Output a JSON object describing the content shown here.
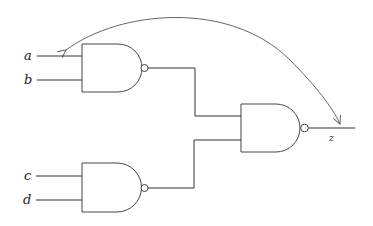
{
  "diagram": {
    "type": "logic-circuit",
    "gates": [
      {
        "id": "nand-1",
        "kind": "NAND",
        "inputs": [
          "a",
          "b"
        ]
      },
      {
        "id": "nand-2",
        "kind": "NAND",
        "inputs": [
          "c",
          "d"
        ]
      },
      {
        "id": "nand-3",
        "kind": "NAND",
        "inputs": [
          "nand-1",
          "nand-2"
        ],
        "output": "z"
      }
    ],
    "labels": {
      "a": "a",
      "b": "b",
      "c": "c",
      "d": "d",
      "z": "z"
    },
    "feedback_arrow": {
      "from": "z",
      "to": "a",
      "style": "curved double-headed"
    }
  }
}
